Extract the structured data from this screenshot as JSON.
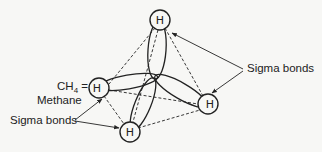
{
  "diagram": {
    "title_formula": "CH",
    "title_subscript": "4",
    "title_equals": " =",
    "title_name": "Methane",
    "labels": {
      "sigma_bonds_right": "Sigma bonds",
      "sigma_bonds_left": "Sigma bonds"
    },
    "atoms": {
      "top": "H",
      "left": "H",
      "right": "H",
      "bottom": "H"
    },
    "colors": {
      "line": "#222222",
      "background": "#f7f7f5"
    }
  }
}
